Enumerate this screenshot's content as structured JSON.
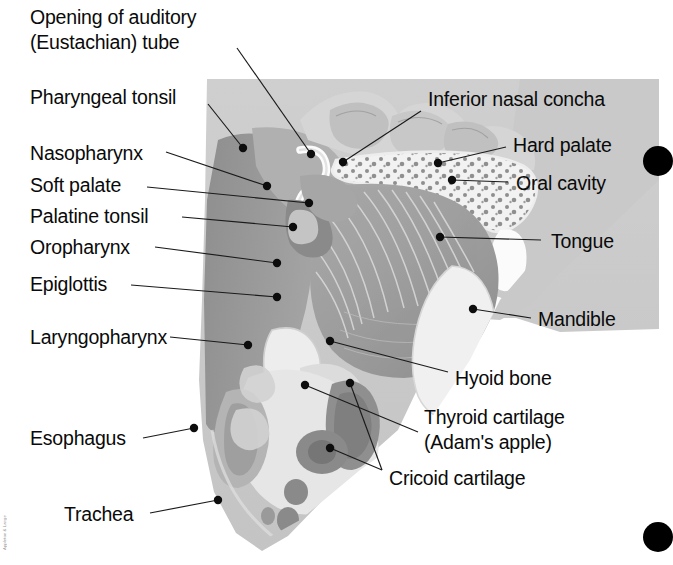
{
  "figure": {
    "background_color": "#ffffff",
    "tissue_base_color": "#c9c9c9",
    "mucosa_color": "#9a9a9a",
    "bone_color": "#e8e8e8",
    "cartilage_color": "#8c8c8c",
    "label_color": "#0a0a0a",
    "leader_color": "#1a1a1a"
  },
  "labels": {
    "left": [
      {
        "id": "eustachian-tube",
        "text_line_1": "Opening of auditory",
        "text_line_2": "(Eustachian) tube"
      },
      {
        "id": "pharyngeal-tonsil",
        "text_line_1": "Pharyngeal tonsil",
        "text_line_2": ""
      },
      {
        "id": "nasopharynx",
        "text_line_1": "Nasopharynx",
        "text_line_2": ""
      },
      {
        "id": "soft-palate",
        "text_line_1": "Soft palate",
        "text_line_2": ""
      },
      {
        "id": "palatine-tonsil",
        "text_line_1": "Palatine tonsil",
        "text_line_2": ""
      },
      {
        "id": "oropharynx",
        "text_line_1": "Oropharynx",
        "text_line_2": ""
      },
      {
        "id": "epiglottis",
        "text_line_1": "Epiglottis",
        "text_line_2": ""
      },
      {
        "id": "laryngopharynx",
        "text_line_1": "Laryngopharynx",
        "text_line_2": ""
      },
      {
        "id": "esophagus",
        "text_line_1": "Esophagus",
        "text_line_2": ""
      },
      {
        "id": "trachea",
        "text_line_1": "Trachea",
        "text_line_2": ""
      }
    ],
    "right": [
      {
        "id": "inferior-nasal-concha",
        "text_line_1": "Inferior nasal concha",
        "text_line_2": ""
      },
      {
        "id": "hard-palate",
        "text_line_1": "Hard palate",
        "text_line_2": ""
      },
      {
        "id": "oral-cavity",
        "text_line_1": "Oral cavity",
        "text_line_2": ""
      },
      {
        "id": "tongue",
        "text_line_1": "Tongue",
        "text_line_2": ""
      },
      {
        "id": "mandible",
        "text_line_1": "Mandible",
        "text_line_2": ""
      },
      {
        "id": "hyoid-bone",
        "text_line_1": "Hyoid bone",
        "text_line_2": ""
      },
      {
        "id": "thyroid-cartilage",
        "text_line_1": "Thyroid cartilage",
        "text_line_2": "(Adam's apple)"
      },
      {
        "id": "cricoid-cartilage",
        "text_line_1": "Cricoid cartilage",
        "text_line_2": ""
      }
    ]
  },
  "credit": {
    "text": "Appleton & Lange"
  }
}
